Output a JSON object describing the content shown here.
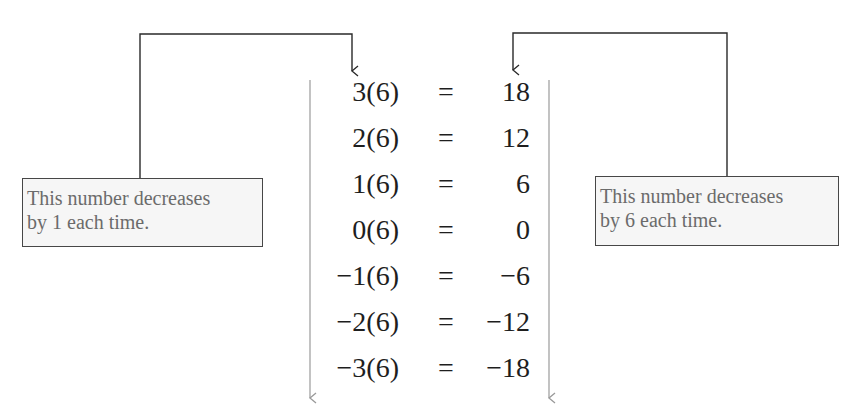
{
  "diagram": {
    "equations": [
      {
        "lhs": "3(6)",
        "sign": "=",
        "rhs": "18"
      },
      {
        "lhs": "2(6)",
        "sign": "=",
        "rhs": "12"
      },
      {
        "lhs": "1(6)",
        "sign": "=",
        "rhs": "6"
      },
      {
        "lhs": "0(6)",
        "sign": "=",
        "rhs": "0"
      },
      {
        "lhs": "−1(6)",
        "sign": "=",
        "rhs": "−6"
      },
      {
        "lhs": "−2(6)",
        "sign": "=",
        "rhs": "−12"
      },
      {
        "lhs": "−3(6)",
        "sign": "=",
        "rhs": "−18"
      }
    ],
    "notes": {
      "left": {
        "line1": "This number decreases",
        "line2": "by 1 each time."
      },
      "right": {
        "line1": "This number decreases",
        "line2": "by 6 each time."
      }
    },
    "colors": {
      "connector": "#2a2a2a",
      "trend_arrow": "#9a9a9a",
      "note_text": "#6b6b6b",
      "note_border": "#474747",
      "note_background": "#f6f6f6",
      "equation_text": "#1e1e1e"
    }
  }
}
